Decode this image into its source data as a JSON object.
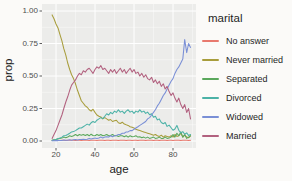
{
  "figure": {
    "background": "#fbfaf8",
    "panel_background": "#ececea",
    "grid_color": "#ffffff",
    "tick_color": "#333333",
    "axis_text_color": "#4d4d4d",
    "title_text_color": "#222222"
  },
  "chart_data": {
    "type": "line",
    "title": "",
    "xlabel": "age",
    "ylabel": "prop",
    "legend_title": "marital",
    "legend_position": "right",
    "xlim": [
      18,
      89
    ],
    "ylim": [
      0,
      1
    ],
    "grid": "on",
    "xticks": [
      "20",
      "40",
      "60",
      "80"
    ],
    "xtick_values": [
      20,
      40,
      60,
      80
    ],
    "x_minor": [
      30,
      50,
      70,
      90
    ],
    "ytick_labels": [
      "1.00",
      "0.75",
      "0.50",
      "0.25",
      "0.00"
    ],
    "ytick_values": [
      0,
      0.25,
      0.5,
      0.75,
      1
    ],
    "y_minor": [
      0.125,
      0.375,
      0.625,
      0.875
    ],
    "x": [
      18,
      19,
      20,
      21,
      22,
      23,
      24,
      25,
      26,
      27,
      28,
      29,
      30,
      31,
      32,
      33,
      34,
      35,
      36,
      37,
      38,
      39,
      40,
      41,
      42,
      43,
      44,
      45,
      46,
      47,
      48,
      49,
      50,
      51,
      52,
      53,
      54,
      55,
      56,
      57,
      58,
      59,
      60,
      61,
      62,
      63,
      64,
      65,
      66,
      67,
      68,
      69,
      70,
      71,
      72,
      73,
      74,
      75,
      76,
      77,
      78,
      79,
      80,
      81,
      82,
      83,
      84,
      85,
      86,
      87,
      88,
      89
    ],
    "series": [
      {
        "name": "No answer",
        "color": "#e8796e",
        "values": [
          0.005,
          0.004,
          0.006,
          0.005,
          0.004,
          0.005,
          0.006,
          0.004,
          0.005,
          0.005,
          0.006,
          0.005,
          0.004,
          0.006,
          0.005,
          0.004,
          0.005,
          0.006,
          0.005,
          0.004,
          0.005,
          0.005,
          0.006,
          0.004,
          0.005,
          0.006,
          0.005,
          0.004,
          0.005,
          0.006,
          0.004,
          0.005,
          0.006,
          0.005,
          0.004,
          0.005,
          0.006,
          0.005,
          0.004,
          0.006,
          0.005,
          0.004,
          0.005,
          0.006,
          0.004,
          0.005,
          0.006,
          0.005,
          0.004,
          0.005,
          0.006,
          0.005,
          0.004,
          0.006,
          0.005,
          0.004,
          0.005,
          0.006,
          0.005,
          0.004,
          0.005,
          0.006,
          0.004,
          0.005,
          0.006,
          0.005,
          0.004,
          0.005,
          0.006,
          0.005,
          0.004,
          0.005
        ]
      },
      {
        "name": "Never married",
        "color": "#a89d3c",
        "values": [
          0.97,
          0.94,
          0.9,
          0.87,
          0.82,
          0.77,
          0.71,
          0.66,
          0.6,
          0.55,
          0.51,
          0.48,
          0.44,
          0.39,
          0.35,
          0.31,
          0.29,
          0.27,
          0.26,
          0.24,
          0.23,
          0.245,
          0.22,
          0.2,
          0.19,
          0.185,
          0.17,
          0.18,
          0.17,
          0.16,
          0.165,
          0.15,
          0.155,
          0.16,
          0.14,
          0.135,
          0.145,
          0.13,
          0.125,
          0.12,
          0.11,
          0.105,
          0.1,
          0.09,
          0.085,
          0.08,
          0.075,
          0.07,
          0.065,
          0.06,
          0.055,
          0.05,
          0.045,
          0.05,
          0.04,
          0.035,
          0.045,
          0.03,
          0.04,
          0.035,
          0.03,
          0.04,
          0.03,
          0.05,
          0.035,
          0.04,
          0.06,
          0.03,
          0.045,
          0.03,
          0.025,
          0.04
        ]
      },
      {
        "name": "Separated",
        "color": "#5ba85c",
        "values": [
          0.005,
          0.01,
          0.012,
          0.018,
          0.02,
          0.022,
          0.03,
          0.025,
          0.03,
          0.04,
          0.035,
          0.04,
          0.05,
          0.04,
          0.05,
          0.045,
          0.05,
          0.042,
          0.05,
          0.04,
          0.052,
          0.042,
          0.04,
          0.05,
          0.042,
          0.05,
          0.04,
          0.045,
          0.05,
          0.04,
          0.042,
          0.05,
          0.04,
          0.042,
          0.035,
          0.04,
          0.04,
          0.032,
          0.04,
          0.03,
          0.04,
          0.032,
          0.035,
          0.04,
          0.03,
          0.032,
          0.025,
          0.03,
          0.022,
          0.03,
          0.02,
          0.025,
          0.03,
          0.02,
          0.022,
          0.03,
          0.02,
          0.02,
          0.03,
          0.02,
          0.022,
          0.03,
          0.05,
          0.03,
          0.06,
          0.04,
          0.07,
          0.03,
          0.05,
          0.02,
          0.03,
          0.04
        ]
      },
      {
        "name": "Divorced",
        "color": "#4cb2a7",
        "values": [
          0.003,
          0.008,
          0.012,
          0.018,
          0.022,
          0.03,
          0.04,
          0.042,
          0.05,
          0.06,
          0.07,
          0.072,
          0.08,
          0.09,
          0.1,
          0.1,
          0.11,
          0.12,
          0.13,
          0.122,
          0.14,
          0.15,
          0.142,
          0.16,
          0.17,
          0.18,
          0.172,
          0.19,
          0.21,
          0.2,
          0.22,
          0.21,
          0.23,
          0.22,
          0.24,
          0.222,
          0.23,
          0.212,
          0.23,
          0.24,
          0.222,
          0.23,
          0.212,
          0.23,
          0.222,
          0.24,
          0.222,
          0.23,
          0.212,
          0.222,
          0.202,
          0.21,
          0.182,
          0.19,
          0.162,
          0.17,
          0.142,
          0.132,
          0.142,
          0.112,
          0.122,
          0.102,
          0.082,
          0.092,
          0.12,
          0.082,
          0.062,
          0.072,
          0.052,
          0.062,
          0.042,
          0.05
        ]
      },
      {
        "name": "Widowed",
        "color": "#7a8fd6",
        "values": [
          0.002,
          0.002,
          0.003,
          0.003,
          0.004,
          0.004,
          0.008,
          0.005,
          0.005,
          0.01,
          0.006,
          0.01,
          0.012,
          0.008,
          0.012,
          0.012,
          0.014,
          0.012,
          0.014,
          0.02,
          0.016,
          0.02,
          0.022,
          0.02,
          0.024,
          0.03,
          0.024,
          0.03,
          0.032,
          0.03,
          0.04,
          0.032,
          0.04,
          0.042,
          0.05,
          0.05,
          0.06,
          0.06,
          0.07,
          0.07,
          0.08,
          0.08,
          0.09,
          0.1,
          0.11,
          0.12,
          0.13,
          0.14,
          0.15,
          0.17,
          0.18,
          0.2,
          0.22,
          0.24,
          0.27,
          0.29,
          0.32,
          0.35,
          0.37,
          0.4,
          0.43,
          0.46,
          0.48,
          0.52,
          0.55,
          0.57,
          0.6,
          0.63,
          0.78,
          0.68,
          0.75,
          0.72
        ]
      },
      {
        "name": "Married",
        "color": "#b2617f",
        "values": [
          0.02,
          0.05,
          0.08,
          0.12,
          0.16,
          0.2,
          0.25,
          0.3,
          0.34,
          0.39,
          0.43,
          0.45,
          0.47,
          0.5,
          0.52,
          0.51,
          0.54,
          0.53,
          0.55,
          0.56,
          0.54,
          0.52,
          0.55,
          0.57,
          0.56,
          0.58,
          0.55,
          0.56,
          0.54,
          0.52,
          0.55,
          0.53,
          0.55,
          0.52,
          0.54,
          0.56,
          0.53,
          0.55,
          0.52,
          0.54,
          0.56,
          0.53,
          0.55,
          0.52,
          0.53,
          0.5,
          0.52,
          0.49,
          0.51,
          0.48,
          0.47,
          0.49,
          0.45,
          0.47,
          0.44,
          0.46,
          0.42,
          0.44,
          0.4,
          0.42,
          0.38,
          0.35,
          0.37,
          0.33,
          0.3,
          0.33,
          0.28,
          0.25,
          0.28,
          0.22,
          0.25,
          0.17
        ]
      }
    ]
  }
}
